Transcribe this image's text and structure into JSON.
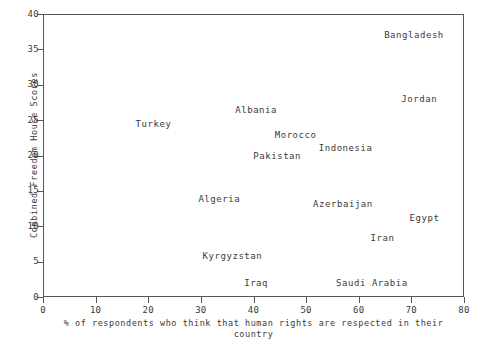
{
  "chart_data": {
    "type": "scatter",
    "title": "",
    "xlabel": "% of respondents who think that human rights are respected in their country",
    "ylabel": "Combined Freedom House Scores",
    "xlim": [
      0,
      80
    ],
    "ylim": [
      0,
      40
    ],
    "xticks": [
      0,
      10,
      20,
      30,
      40,
      50,
      60,
      70,
      80
    ],
    "yticks": [
      0,
      5,
      10,
      15,
      20,
      25,
      30,
      35,
      40
    ],
    "grid": false,
    "legend": "none",
    "marker_style": "text-label-only",
    "points": [
      {
        "label": "Bangladesh",
        "x": 70.5,
        "y": 37.0
      },
      {
        "label": "Jordan",
        "x": 71.5,
        "y": 28.0
      },
      {
        "label": "Albania",
        "x": 40.5,
        "y": 26.5
      },
      {
        "label": "Turkey",
        "x": 21.0,
        "y": 24.5
      },
      {
        "label": "Morocco",
        "x": 48.0,
        "y": 22.9
      },
      {
        "label": "Indonesia",
        "x": 57.5,
        "y": 21.0
      },
      {
        "label": "Pakistan",
        "x": 44.5,
        "y": 20.0
      },
      {
        "label": "Algeria",
        "x": 33.5,
        "y": 13.8
      },
      {
        "label": "Azerbaijan",
        "x": 57.0,
        "y": 13.2
      },
      {
        "label": "Egypt",
        "x": 72.5,
        "y": 11.2
      },
      {
        "label": "Iran",
        "x": 64.5,
        "y": 8.3
      },
      {
        "label": "Kyrgyzstan",
        "x": 36.0,
        "y": 5.8
      },
      {
        "label": "Iraq",
        "x": 40.5,
        "y": 2.0
      },
      {
        "label": "Saudi Arabia",
        "x": 62.5,
        "y": 2.0
      }
    ]
  },
  "axis": {
    "x_tick_labels": [
      "0",
      "10",
      "20",
      "30",
      "40",
      "50",
      "60",
      "70",
      "80"
    ],
    "y_tick_labels": [
      "0",
      "5",
      "10",
      "15",
      "20",
      "25",
      "30",
      "35",
      "40"
    ],
    "x_title": "% of respondents who think that human rights are respected in their country",
    "y_title": "Combined Freedom House Scores"
  },
  "colors": {
    "background": "#ffffff",
    "axis": "#555555",
    "text": "#3a3a3a"
  }
}
